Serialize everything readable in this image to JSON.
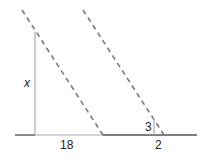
{
  "diagram": {
    "type": "similar-triangles",
    "labels": {
      "x": "x",
      "base_large": "18",
      "height_small": "3",
      "base_small": "2"
    },
    "colors": {
      "dashed": "#7a7a7a",
      "solid": "#9a9a9a",
      "baseline": "#555555",
      "text": "#222222"
    }
  }
}
